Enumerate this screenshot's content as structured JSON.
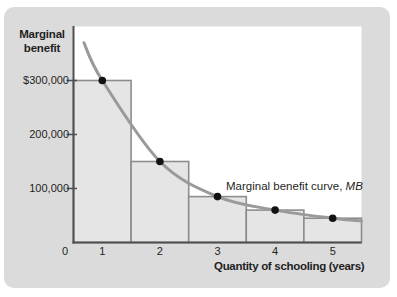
{
  "chart_data": {
    "type": "bar",
    "title": "Marginal benefit",
    "title_lines": [
      "Marginal",
      "benefit"
    ],
    "xlabel": "Quantity of schooling (years)",
    "ylabel": "Marginal benefit",
    "categories": [
      "1",
      "2",
      "3",
      "4",
      "5"
    ],
    "values": [
      300000,
      150000,
      85000,
      60000,
      45000
    ],
    "x_ticks": [
      {
        "value": 0,
        "label": "0"
      },
      {
        "value": 1,
        "label": "1"
      },
      {
        "value": 2,
        "label": "2"
      },
      {
        "value": 3,
        "label": "3"
      },
      {
        "value": 4,
        "label": "4"
      },
      {
        "value": 5,
        "label": "5"
      }
    ],
    "y_ticks": [
      {
        "value": 300000,
        "label": "$300,000"
      },
      {
        "value": 200000,
        "label": "200,000"
      },
      {
        "value": 100000,
        "label": "100,000"
      }
    ],
    "ylim": [
      0,
      400000
    ],
    "xlim": [
      0.5,
      5.5
    ],
    "grid": false,
    "legend": "none",
    "annotation_prefix": "Marginal benefit curve, ",
    "annotation_italic": "MB",
    "overlay_line": {
      "name": "Marginal benefit curve, MB",
      "points_q_value": [
        [
          0.68,
          370000
        ],
        [
          1,
          300000
        ],
        [
          2,
          150000
        ],
        [
          3,
          85000
        ],
        [
          4,
          60000
        ],
        [
          5,
          45000
        ],
        [
          5.5,
          40000
        ]
      ]
    },
    "colors": {
      "card_bg": "#dbdbdb",
      "plot_bg": "#ffffff",
      "bar_fill": "#e5e5e5",
      "bar_border": "#8d8d8d",
      "curve": "#9a9a9a",
      "dot": "#121212",
      "axis": "#4f4f4f",
      "text": "#1f1f1f"
    }
  }
}
